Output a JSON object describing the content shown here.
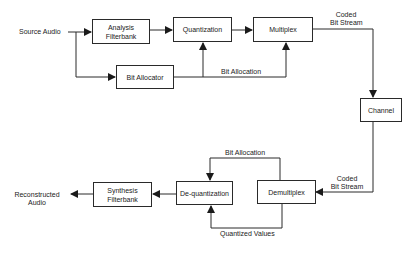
{
  "diagram": {
    "encoder": {
      "input_label": "Source Audio",
      "blocks": {
        "analysis": "Analysis Filterbank",
        "analysis_line1": "Analysis",
        "analysis_line2": "Filterbank",
        "quantization": "Quantization",
        "multiplex": "Multiplex",
        "bit_allocator": "Bit Allocator"
      },
      "bit_allocation_label": "Bit Allocation",
      "output_label_line1": "Coded",
      "output_label_line2": "Bit Stream"
    },
    "channel": {
      "label": "Channel"
    },
    "decoder": {
      "input_label_line1": "Coded",
      "input_label_line2": "Bit Stream",
      "blocks": {
        "demultiplex": "Demultiplex",
        "dequantization": "De-quantization",
        "synthesis_line1": "Synthesis",
        "synthesis_line2": "Filterbank"
      },
      "bit_allocation_label": "Bit Allocation",
      "quantized_values_label": "Quantized Values",
      "output_label_line1": "Reconstructed",
      "output_label_line2": "Audio"
    },
    "colors": {
      "line": "#2a2a2a",
      "background": "#ffffff",
      "text": "#222222"
    }
  }
}
